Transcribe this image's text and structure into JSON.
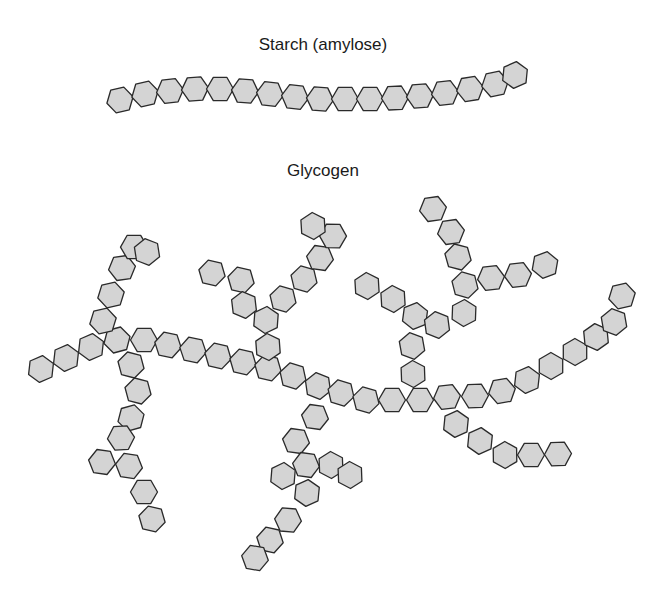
{
  "figure": {
    "starch_title": "Starch (amylose)",
    "glycogen_title": "Glycogen",
    "colors": {
      "fill": "#d4d4d4",
      "stroke": "#2a2a2a",
      "background": "#ffffff"
    },
    "hex_radius": 13.5
  },
  "starch": {
    "label": "Starch (amylose)",
    "units": [
      [
        120,
        100
      ],
      [
        145,
        94
      ],
      [
        170,
        91
      ],
      [
        195,
        89
      ],
      [
        220,
        89
      ],
      [
        245,
        91
      ],
      [
        270,
        94
      ],
      [
        295,
        97
      ],
      [
        320,
        99
      ],
      [
        345,
        99
      ],
      [
        370,
        99
      ],
      [
        395,
        98
      ],
      [
        420,
        96
      ],
      [
        445,
        93
      ],
      [
        470,
        89
      ],
      [
        495,
        84
      ],
      [
        515,
        75
      ]
    ]
  },
  "glycogen": {
    "label": "Glycogen",
    "chains": [
      {
        "name": "main-chain",
        "units": [
          [
            41,
            369
          ],
          [
            66,
            358
          ],
          [
            91,
            347
          ],
          [
            117,
            340
          ],
          [
            144,
            340
          ],
          [
            168,
            345
          ],
          [
            193,
            350
          ],
          [
            218,
            356
          ],
          [
            243,
            362
          ],
          [
            268,
            368
          ],
          [
            293,
            376
          ],
          [
            318,
            386
          ],
          [
            341,
            393
          ],
          [
            366,
            400
          ],
          [
            392,
            400
          ],
          [
            420,
            400
          ],
          [
            447,
            397
          ],
          [
            475,
            396
          ],
          [
            502,
            391
          ],
          [
            527,
            380
          ],
          [
            551,
            366
          ],
          [
            575,
            352
          ],
          [
            596,
            337
          ],
          [
            614,
            322
          ],
          [
            622,
            296
          ]
        ]
      },
      {
        "name": "branch-upper-left",
        "units": [
          [
            103,
            321
          ],
          [
            111,
            295
          ],
          [
            122,
            268
          ],
          [
            134,
            247
          ],
          [
            147,
            252
          ]
        ]
      },
      {
        "name": "branch-lower-left",
        "units": [
          [
            131,
            365
          ],
          [
            138,
            391
          ],
          [
            131,
            418
          ],
          [
            121,
            438
          ],
          [
            102,
            462
          ],
          [
            129,
            466
          ],
          [
            144,
            492
          ],
          [
            152,
            519
          ]
        ]
      },
      {
        "name": "branch-upper-mid-left",
        "units": [
          [
            212,
            273
          ],
          [
            241,
            280
          ],
          [
            244,
            305
          ],
          [
            266,
            320
          ],
          [
            268,
            347
          ]
        ]
      },
      {
        "name": "branch-upper-mid-right",
        "units": [
          [
            283,
            299
          ],
          [
            304,
            279
          ],
          [
            320,
            258
          ],
          [
            333,
            236
          ],
          [
            313,
            226
          ]
        ]
      },
      {
        "name": "branch-center-down",
        "units": [
          [
            315,
            417
          ],
          [
            296,
            441
          ],
          [
            306,
            465
          ],
          [
            283,
            476
          ],
          [
            307,
            493
          ],
          [
            288,
            520
          ],
          [
            270,
            540
          ],
          [
            255,
            558
          ]
        ]
      },
      {
        "name": "branch-center-right",
        "units": [
          [
            331,
            465
          ],
          [
            350,
            475
          ]
        ]
      },
      {
        "name": "branch-upper-right-left",
        "units": [
          [
            367,
            286
          ],
          [
            393,
            299
          ],
          [
            415,
            316
          ],
          [
            437,
            325
          ],
          [
            412,
            346
          ],
          [
            413,
            374
          ]
        ]
      },
      {
        "name": "branch-upper-right-up",
        "units": [
          [
            433,
            209
          ],
          [
            451,
            232
          ],
          [
            458,
            257
          ],
          [
            465,
            285
          ],
          [
            464,
            313
          ]
        ]
      },
      {
        "name": "branch-upper-right-side",
        "units": [
          [
            491,
            278
          ],
          [
            518,
            275
          ],
          [
            545,
            265
          ]
        ]
      },
      {
        "name": "branch-lower-right",
        "units": [
          [
            456,
            424
          ],
          [
            480,
            441
          ],
          [
            505,
            455
          ],
          [
            531,
            455
          ],
          [
            558,
            454
          ]
        ]
      }
    ]
  }
}
